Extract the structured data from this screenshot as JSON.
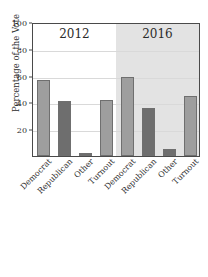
{
  "chart_data": {
    "type": "bar",
    "title": "",
    "title_clipped": true,
    "xlabel": "",
    "ylabel": "Percentage of the Vote",
    "ylim": [
      0,
      100
    ],
    "yticks": [
      0,
      20,
      40,
      60,
      80,
      100
    ],
    "ytick_labels": [
      "",
      "20",
      "40",
      "60",
      "80",
      "100"
    ],
    "grid": true,
    "legend": "none",
    "panels": [
      {
        "label": "2012",
        "background": "#ffffff",
        "categories": [
          "Democrat",
          "Republican",
          "Other",
          "Turnout"
        ],
        "values": [
          57,
          41,
          2,
          42
        ],
        "bar_shades": [
          "light",
          "dark",
          "dark",
          "light"
        ]
      },
      {
        "label": "2016",
        "background": "#e3e3e3",
        "categories": [
          "Democrat",
          "Republican",
          "Other",
          "Turnout"
        ],
        "values": [
          59,
          36,
          5,
          45
        ],
        "bar_shades": [
          "light",
          "dark",
          "dark",
          "light"
        ]
      }
    ],
    "colors": {
      "bar_light": "#9e9e9e",
      "bar_dark": "#6e6e6e",
      "bar_edge": "#6f6f6f",
      "panel_shaded": "#e3e3e3",
      "frame": "#4a4a4a",
      "gridline": "#d9d9d9"
    }
  }
}
